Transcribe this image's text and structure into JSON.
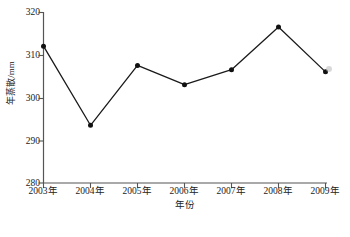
{
  "chart_data": {
    "type": "line",
    "title": "",
    "xlabel": "年份",
    "ylabel": "年蒸散/mm",
    "categories": [
      "2003年",
      "2004年",
      "2005年",
      "2006年",
      "2007年",
      "2008年",
      "2009年"
    ],
    "x": [
      2003,
      2004,
      2005,
      2006,
      2007,
      2008,
      2009
    ],
    "values": [
      312.0,
      293.5,
      307.5,
      303.0,
      306.5,
      316.5,
      306.0
    ],
    "series": [
      {
        "name": "年蒸散",
        "values": [
          312.0,
          293.5,
          307.5,
          303.0,
          306.5,
          316.5,
          306.0
        ]
      }
    ],
    "ylim": [
      280,
      320
    ],
    "yticks": [
      280,
      290,
      300,
      310,
      320
    ],
    "ytick_labels": [
      "280",
      "290",
      "300",
      "310",
      "320"
    ],
    "grid": false,
    "legend": "none",
    "marker": "filled-circle",
    "line_color": "#1a1a1a",
    "marker_color": "#111111",
    "axis_color": "#555555"
  },
  "axes": {
    "y_title": "年蒸散/mm",
    "x_title": "年份",
    "y_labels": [
      "320",
      "310",
      "300",
      "290",
      "280"
    ],
    "x_labels": [
      "2003年",
      "2004年",
      "2005年",
      "2006年",
      "2007年",
      "2008年",
      "2009年"
    ]
  },
  "annotations": {
    "smudge_label": "scan-artifact"
  }
}
